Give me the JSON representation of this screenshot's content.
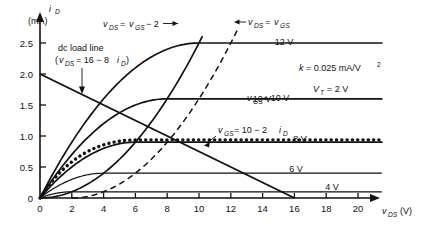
{
  "chart_data": {
    "type": "line",
    "title": "",
    "xlabel": "v_DS (V)",
    "ylabel": "i_D (mA)",
    "xlim": [
      0,
      21.5
    ],
    "ylim": [
      0,
      2.75
    ],
    "grid": false,
    "legend_position": "inline-right-labels",
    "device_params": {
      "k": 0.025,
      "k_units": "mA/V^2",
      "VT": 2,
      "VT_units": "V"
    },
    "x_ticks": [
      0,
      2,
      4,
      6,
      8,
      10,
      12,
      14,
      16,
      18,
      20
    ],
    "x_tick_labels": [
      "0",
      "2",
      "4",
      "6",
      "8",
      "10",
      "12",
      "14",
      "16",
      "18",
      "20"
    ],
    "y_ticks": [
      0,
      0.5,
      1.0,
      1.5,
      2.0,
      2.5
    ],
    "y_tick_labels": [
      "0",
      "0.5",
      "1.0",
      "1.5",
      "2.0",
      "2.5"
    ],
    "series": [
      {
        "name": "vGS_12V",
        "vgs": 12,
        "label": "12 V",
        "isat": 2.5,
        "vsat": 10,
        "label_x": 284,
        "label_y": 45
      },
      {
        "name": "vGS_10V",
        "vgs": 10,
        "label": "10 V",
        "isat": 1.6,
        "vsat": 8,
        "label_x": 262,
        "label_y": 102
      },
      {
        "name": "vGS_8V",
        "vgs": 8,
        "label": "8 V",
        "isat": 0.9,
        "vsat": 6,
        "label_x": 300,
        "label_y": 142
      },
      {
        "name": "vGS_6V",
        "vgs": 6,
        "label": "6 V",
        "isat": 0.4,
        "vsat": 4,
        "label_x": 296,
        "label_y": 172
      },
      {
        "name": "vGS_4V",
        "vgs": 4,
        "label": "4 V",
        "isat": 0.1,
        "vsat": 2,
        "label_x": 332,
        "label_y": 190
      }
    ],
    "load_line": {
      "name": "dc_load_line",
      "equation": "v_DS = 16 - 8 i_D",
      "x_intercept": 16,
      "y_intercept": 2.0
    },
    "boundary_curve": {
      "name": "saturation_boundary",
      "equation": "v_DS = v_GS - 2"
    },
    "dashed_curve": {
      "name": "vds_equals_vgs",
      "equation": "v_DS = v_GS"
    },
    "dotted_curve": {
      "name": "source_resistor_constraint",
      "equation": "v_GS = 10 - 2 i_D",
      "isat": 0.95
    }
  },
  "axes": {
    "y_label_main": "i",
    "y_label_sub": "D",
    "y_label_units": "(mA)",
    "x_label_main": "v",
    "x_label_sub": "DS",
    "x_label_units": "(V)"
  },
  "annotations": {
    "boundary": {
      "v1": "v",
      "v1sub": "DS",
      "eq": "=",
      "v2": "v",
      "v2sub": "GS",
      "tail": "− 2"
    },
    "dashed": {
      "v1": "v",
      "v1sub": "DS",
      "eq": "=",
      "v2": "v",
      "v2sub": "GS"
    },
    "load_line": {
      "line1": "dc load line",
      "open": "(",
      "v": "v",
      "vsub": "DS",
      "eq": "= 16 − 8",
      "i": "i",
      "isub": "D",
      "close": ")"
    },
    "dotted": {
      "v": "v",
      "vsub": "GS",
      "eq": "= 10 − 2",
      "i": "i",
      "isub": "D"
    },
    "vgs10": {
      "v": "v",
      "vsub": "GS",
      "eq": "= 10 V"
    },
    "params": {
      "k_sym": "k",
      "k_eq": "= 0.025 mA/V",
      "k_exp": "2",
      "vt_sym": "V",
      "vt_sub": "T",
      "vt_eq": "= 2 V"
    }
  },
  "colors": {
    "ink": "#111111",
    "background": "#ffffff"
  }
}
